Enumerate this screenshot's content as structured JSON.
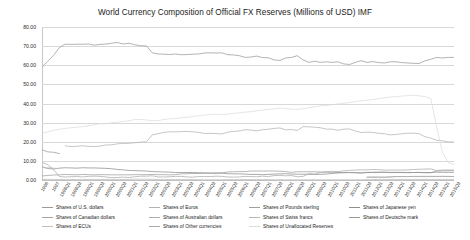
{
  "chart_data": {
    "type": "line",
    "title": "World Currency Composition of Official FX Reserves  (Millions of USD) IMF",
    "xlabel": "",
    "ylabel": "",
    "ylim": [
      0,
      80
    ],
    "ytick_labels": [
      "80.00",
      "70.00",
      "60.00",
      "50.00",
      "40.00",
      "30.00",
      "20.00",
      "10.00",
      "0.00"
    ],
    "ytick_values": [
      80,
      70,
      60,
      50,
      40,
      30,
      20,
      10,
      0
    ],
    "grid": true,
    "legend_position": "bottom",
    "x": [
      "1995Q4",
      "1996Q4",
      "1997Q4",
      "1998Q4",
      "1999Q1",
      "1999Q2",
      "1999Q3",
      "1999Q4",
      "2000Q1",
      "2000Q2",
      "2000Q3",
      "2000Q4",
      "2001Q1",
      "2001Q2",
      "2001Q3",
      "2001Q4",
      "2002Q1",
      "2002Q2",
      "2002Q3",
      "2002Q4",
      "2003Q1",
      "2003Q2",
      "2003Q3",
      "2003Q4",
      "2004Q1",
      "2004Q2",
      "2004Q3",
      "2004Q4",
      "2005Q1",
      "2005Q2",
      "2005Q3",
      "2005Q4",
      "2006Q1",
      "2006Q2",
      "2006Q3",
      "2006Q4",
      "2007Q1",
      "2007Q2",
      "2007Q3",
      "2007Q4",
      "2008Q1",
      "2008Q2",
      "2008Q3",
      "2008Q4",
      "2009Q1",
      "2009Q2",
      "2009Q3",
      "2009Q4",
      "2010Q1",
      "2010Q2",
      "2010Q3",
      "2010Q4",
      "2011Q1",
      "2011Q2",
      "2011Q3",
      "2011Q4",
      "2012Q1",
      "2012Q2",
      "2012Q3",
      "2012Q4",
      "2013Q1",
      "2013Q2",
      "2013Q3",
      "2013Q4",
      "2014Q1",
      "2014Q2",
      "2014Q3",
      "2014Q4",
      "2015Q1",
      "2015Q2",
      "2015Q3",
      "2015Q4"
    ],
    "xtick_labels": [
      "1996",
      "1997",
      "1998Q1",
      "1998Q3",
      "1999Q1",
      "1999Q3",
      "2000Q1",
      "2000Q3",
      "2001Q1",
      "2001Q3",
      "2002Q1",
      "2002Q3",
      "2003Q1",
      "2003Q3",
      "2004Q1",
      "2004Q3",
      "2005Q1",
      "2005Q3",
      "2006Q1",
      "2006Q3",
      "2007Q1",
      "2007Q3",
      "2008Q1",
      "2008Q3",
      "2009Q1",
      "2009Q3",
      "2010Q1",
      "2010Q3",
      "2011Q1",
      "2011Q3",
      "2012Q1",
      "2012Q3",
      "2013Q1",
      "2013Q3",
      "2014Q1",
      "2014Q3",
      "2015Q1",
      "2015Q3"
    ],
    "series": [
      {
        "name": "Shares of U.S. dollars",
        "color": "#9a9a9a",
        "values": [
          59.0,
          62.1,
          65.2,
          69.3,
          71.0,
          70.9,
          71.0,
          71.0,
          71.1,
          70.5,
          70.9,
          71.1,
          71.5,
          71.9,
          71.1,
          71.5,
          70.7,
          70.2,
          70.1,
          66.5,
          65.9,
          65.8,
          65.6,
          65.9,
          65.5,
          65.6,
          65.8,
          65.9,
          66.4,
          66.5,
          66.4,
          66.5,
          65.5,
          65.4,
          65.0,
          64.1,
          64.3,
          64.8,
          64.0,
          63.9,
          62.8,
          62.5,
          63.8,
          64.1,
          65.0,
          62.8,
          61.5,
          62.1,
          61.5,
          61.8,
          61.5,
          61.8,
          60.7,
          60.4,
          61.5,
          62.4,
          61.5,
          61.9,
          61.4,
          61.2,
          61.8,
          61.8,
          61.4,
          61.2,
          61.0,
          60.9,
          62.3,
          63.1,
          64.1,
          63.8,
          64.1,
          64.1
        ]
      },
      {
        "name": "Shares of Euros",
        "color": "#b3b3b3",
        "values": [
          null,
          null,
          null,
          null,
          17.9,
          17.5,
          17.6,
          17.9,
          17.6,
          17.5,
          17.7,
          18.3,
          18.4,
          18.9,
          19.1,
          19.2,
          19.5,
          19.8,
          20.0,
          23.6,
          24.2,
          24.9,
          25.2,
          25.2,
          25.3,
          25.4,
          25.2,
          24.9,
          24.3,
          24.4,
          24.3,
          24.1,
          25.0,
          25.4,
          25.6,
          26.3,
          26.1,
          25.7,
          26.3,
          26.5,
          27.0,
          27.2,
          26.2,
          26.4,
          25.9,
          27.9,
          27.8,
          27.6,
          27.3,
          26.6,
          26.6,
          26.0,
          26.6,
          26.7,
          25.6,
          24.8,
          25.0,
          24.9,
          24.4,
          24.2,
          23.6,
          23.8,
          24.2,
          24.4,
          24.5,
          24.2,
          22.6,
          21.9,
          20.8,
          20.5,
          19.9,
          19.9
        ]
      },
      {
        "name": "Shares of Pounds sterling",
        "color": "#9f9f9f",
        "values": [
          2.1,
          2.4,
          2.6,
          2.7,
          2.9,
          2.8,
          2.7,
          2.9,
          2.8,
          2.7,
          2.8,
          2.8,
          2.7,
          2.7,
          2.7,
          2.7,
          2.8,
          2.8,
          2.8,
          2.9,
          2.8,
          2.8,
          2.7,
          2.8,
          3.2,
          3.3,
          3.4,
          3.4,
          3.6,
          3.6,
          3.7,
          3.7,
          4.2,
          4.3,
          4.4,
          4.4,
          4.7,
          4.7,
          4.7,
          4.7,
          4.7,
          4.6,
          4.4,
          4.0,
          4.3,
          4.3,
          4.3,
          4.3,
          4.2,
          4.0,
          4.0,
          3.9,
          3.9,
          3.9,
          3.8,
          3.8,
          4.0,
          4.0,
          4.0,
          4.0,
          4.0,
          4.0,
          4.0,
          4.0,
          3.9,
          3.9,
          3.8,
          3.8,
          4.7,
          4.8,
          4.9,
          4.9
        ]
      },
      {
        "name": "Shares of Japanese yen",
        "color": "#8e8e8e",
        "values": [
          6.8,
          6.0,
          5.8,
          6.2,
          6.4,
          6.3,
          6.2,
          6.4,
          6.3,
          6.3,
          6.2,
          6.1,
          5.9,
          5.5,
          5.3,
          5.0,
          4.9,
          4.8,
          4.7,
          4.4,
          4.3,
          4.2,
          4.1,
          3.9,
          3.9,
          3.9,
          3.9,
          3.8,
          3.7,
          3.6,
          3.5,
          3.6,
          3.3,
          3.2,
          3.2,
          3.1,
          2.9,
          2.9,
          2.8,
          2.9,
          3.1,
          3.2,
          3.3,
          3.1,
          3.0,
          3.0,
          3.0,
          2.9,
          3.0,
          3.1,
          3.4,
          3.7,
          3.8,
          3.9,
          3.8,
          3.6,
          3.9,
          4.0,
          4.1,
          4.1,
          3.9,
          3.9,
          3.9,
          3.8,
          3.9,
          4.0,
          3.9,
          3.9,
          4.1,
          4.0,
          4.0,
          4.0
        ]
      },
      {
        "name": "Shares of Canadian dollars",
        "color": "#a5a5a5",
        "values": [
          null,
          null,
          null,
          null,
          null,
          null,
          null,
          null,
          null,
          null,
          null,
          null,
          null,
          null,
          null,
          null,
          null,
          null,
          null,
          null,
          null,
          null,
          null,
          null,
          null,
          null,
          null,
          null,
          null,
          null,
          null,
          null,
          null,
          null,
          null,
          null,
          null,
          null,
          null,
          null,
          null,
          null,
          null,
          null,
          null,
          null,
          null,
          null,
          null,
          null,
          null,
          null,
          null,
          null,
          null,
          null,
          1.4,
          1.5,
          1.5,
          1.4,
          1.6,
          1.8,
          1.8,
          1.8,
          1.9,
          1.9,
          1.9,
          1.9,
          1.9,
          1.9,
          1.8,
          1.8
        ]
      },
      {
        "name": "Shares of Australian dollars",
        "color": "#adadad",
        "values": [
          null,
          null,
          null,
          null,
          null,
          null,
          null,
          null,
          null,
          null,
          null,
          null,
          null,
          null,
          null,
          null,
          null,
          null,
          null,
          null,
          null,
          null,
          null,
          null,
          null,
          null,
          null,
          null,
          null,
          null,
          null,
          null,
          null,
          null,
          null,
          null,
          null,
          null,
          null,
          null,
          null,
          null,
          null,
          null,
          null,
          null,
          null,
          null,
          null,
          null,
          null,
          null,
          null,
          null,
          null,
          null,
          1.5,
          1.5,
          1.5,
          1.5,
          1.6,
          1.8,
          1.8,
          1.8,
          1.8,
          1.8,
          1.8,
          1.8,
          1.8,
          1.9,
          1.9,
          1.8
        ]
      },
      {
        "name": "Shares of Swiss francs",
        "color": "#b8b8b8",
        "values": [
          0.3,
          0.3,
          0.3,
          0.3,
          0.2,
          0.2,
          0.2,
          0.2,
          0.3,
          0.3,
          0.3,
          0.3,
          0.3,
          0.3,
          0.3,
          0.3,
          0.4,
          0.4,
          0.4,
          0.4,
          0.2,
          0.2,
          0.2,
          0.2,
          0.2,
          0.2,
          0.2,
          0.2,
          0.1,
          0.1,
          0.1,
          0.1,
          0.2,
          0.2,
          0.2,
          0.2,
          0.2,
          0.2,
          0.2,
          0.2,
          0.1,
          0.1,
          0.1,
          0.1,
          0.1,
          0.1,
          0.1,
          0.1,
          0.1,
          0.1,
          0.1,
          0.1,
          0.1,
          0.1,
          0.1,
          0.1,
          0.2,
          0.2,
          0.3,
          0.3,
          0.3,
          0.3,
          0.3,
          0.3,
          0.3,
          0.3,
          0.3,
          0.3,
          0.3,
          0.3,
          0.3,
          0.3
        ]
      },
      {
        "name": "Shares of Deutsche mark",
        "color": "#999999",
        "values": [
          15.8,
          14.7,
          14.5,
          13.8,
          null,
          null,
          null,
          null,
          null,
          null,
          null,
          null,
          null,
          null,
          null,
          null,
          null,
          null,
          null,
          null,
          null,
          null,
          null,
          null,
          null,
          null,
          null,
          null,
          null,
          null,
          null,
          null,
          null,
          null,
          null,
          null,
          null,
          null,
          null,
          null,
          null,
          null,
          null,
          null,
          null,
          null,
          null,
          null,
          null,
          null,
          null,
          null,
          null,
          null,
          null,
          null,
          null,
          null,
          null,
          null,
          null,
          null,
          null,
          null,
          null,
          null,
          null,
          null,
          null,
          null,
          null,
          null
        ]
      },
      {
        "name": "Shares of ECUs",
        "color": "#c0c0c0",
        "values": [
          6.8,
          6.5,
          6.2,
          5.9,
          null,
          null,
          null,
          null,
          null,
          null,
          null,
          null,
          null,
          null,
          null,
          null,
          null,
          null,
          null,
          null,
          null,
          null,
          null,
          null,
          null,
          null,
          null,
          null,
          null,
          null,
          null,
          null,
          null,
          null,
          null,
          null,
          null,
          null,
          null,
          null,
          null,
          null,
          null,
          null,
          null,
          null,
          null,
          null,
          null,
          null,
          null,
          null,
          null,
          null,
          null,
          null,
          null,
          null,
          null,
          null,
          null,
          null,
          null,
          null,
          null,
          null,
          null,
          null,
          null,
          null,
          null,
          null
        ]
      },
      {
        "name": "Shares of Other currencies",
        "color": "#ababab",
        "values": [
          9.2,
          8.0,
          5.4,
          1.8,
          1.6,
          1.7,
          1.8,
          1.6,
          1.9,
          2.0,
          1.9,
          1.6,
          1.2,
          1.3,
          1.5,
          1.3,
          1.7,
          2.0,
          2.0,
          2.2,
          1.6,
          1.6,
          1.7,
          1.9,
          1.9,
          1.6,
          1.5,
          1.8,
          1.8,
          1.8,
          2.0,
          1.9,
          1.6,
          1.5,
          1.6,
          1.9,
          1.8,
          1.7,
          2.0,
          1.8,
          2.3,
          2.4,
          2.2,
          2.3,
          1.7,
          1.9,
          3.3,
          3.1,
          4.0,
          4.4,
          4.5,
          4.4,
          4.8,
          5.0,
          5.2,
          5.3,
          5.3,
          5.5,
          5.4,
          5.2,
          5.2,
          5.2,
          5.2,
          5.3,
          5.5,
          5.6,
          5.7,
          5.8,
          5.0,
          5.2,
          5.2,
          5.2
        ]
      },
      {
        "name": "Shares of Unallocated Reserves",
        "color": "#dcdcdc",
        "values": [
          24.5,
          25.1,
          26.0,
          26.5,
          27.0,
          27.3,
          27.6,
          27.9,
          28.4,
          28.9,
          29.4,
          29.4,
          29.9,
          30.2,
          30.6,
          31.0,
          31.6,
          31.6,
          31.4,
          31.0,
          31.1,
          31.6,
          32.0,
          32.1,
          32.5,
          32.8,
          33.2,
          33.6,
          34.0,
          34.2,
          34.4,
          34.2,
          34.5,
          34.8,
          35.2,
          35.5,
          35.7,
          36.2,
          36.6,
          36.9,
          37.2,
          37.6,
          37.3,
          37.1,
          36.9,
          37.3,
          37.8,
          38.2,
          38.8,
          39.0,
          39.4,
          39.8,
          40.1,
          40.5,
          41.0,
          41.4,
          41.8,
          42.0,
          42.6,
          43.0,
          43.4,
          43.6,
          43.9,
          44.1,
          44.3,
          44.0,
          43.6,
          42.6,
          28.0,
          14.5,
          9.2,
          8.0
        ]
      }
    ]
  },
  "legend": {
    "columns": [
      [
        "Shares of U.S. dollars",
        "Shares of Canadian dollars",
        "Shares of ECUs"
      ],
      [
        "Shares of Euros",
        "Shares of Australian dollars",
        "Shares of Other currencies"
      ],
      [
        "Shares of Pounds sterling",
        "Shares of Swiss francs",
        "Shares of Unallocated Reserves"
      ],
      [
        "Shares of Japanese yen",
        "Shares of Deutsche mark"
      ]
    ]
  }
}
